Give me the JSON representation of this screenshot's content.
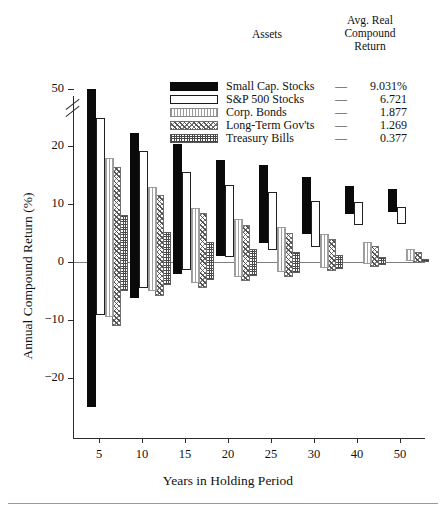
{
  "legend": {
    "assets_header": "Assets",
    "return_header": "Avg. Real\nCompound\nReturn",
    "return_header_l1": "Avg. Real",
    "return_header_l2": "Compound",
    "return_header_l3": "Return",
    "dash": "—",
    "rows": [
      {
        "swatch": "small-cap-swatch",
        "label": "Small Cap. Stocks",
        "value": "9.031%"
      },
      {
        "swatch": "sp500-swatch",
        "label": "S&P 500 Stocks",
        "value": "6.721"
      },
      {
        "swatch": "corp-bonds-swatch",
        "label": "Corp. Bonds",
        "value": "1.877"
      },
      {
        "swatch": "ltgov-swatch",
        "label": "Long-Term Gov'ts",
        "value": "1.269"
      },
      {
        "swatch": "tbills-swatch",
        "label": "Treasury Bills",
        "value": "0.377"
      }
    ]
  },
  "chart_data": {
    "type": "bar",
    "subtype": "range-bars-high-low",
    "title": "",
    "xlabel": "Years in Holding Period",
    "ylabel": "Annual Compound Return (%)",
    "x": [
      5,
      10,
      15,
      20,
      25,
      30,
      40,
      50
    ],
    "categories": [
      "5",
      "10",
      "15",
      "20",
      "25",
      "30",
      "40",
      "50"
    ],
    "xtick_labels": [
      "5",
      "10",
      "15",
      "20",
      "25",
      "30",
      "40",
      "50"
    ],
    "ytick_labels": [
      "50",
      "20",
      "10",
      "0",
      "-10",
      "-20"
    ],
    "yticks": [
      50,
      20,
      10,
      0,
      -10,
      -20
    ],
    "ylim": [
      -26,
      51
    ],
    "y_axis_break": {
      "between": [
        25,
        45
      ],
      "note": "axis broken above 25%"
    },
    "grid": false,
    "zero_line": true,
    "legend_position": "top-right",
    "series": [
      {
        "name": "Small Cap. Stocks",
        "avg_real_compound_return": 9.031,
        "color": "#0a0a0a",
        "fill": "solid-black",
        "ranges": [
          {
            "x": 5,
            "high": 50.0,
            "low": -25.0
          },
          {
            "x": 10,
            "high": 22.3,
            "low": -6.2
          },
          {
            "x": 15,
            "high": 20.4,
            "low": -2.1
          },
          {
            "x": 20,
            "high": 17.6,
            "low": 1.0
          },
          {
            "x": 25,
            "high": 16.8,
            "low": 3.3
          },
          {
            "x": 30,
            "high": 14.6,
            "low": 4.9
          },
          {
            "x": 40,
            "high": 13.1,
            "low": 8.3
          },
          {
            "x": 50,
            "high": 12.6,
            "low": 8.6
          }
        ]
      },
      {
        "name": "S&P 500 Stocks",
        "avg_real_compound_return": 6.721,
        "color": "#ffffff",
        "fill": "white-outline",
        "ranges": [
          {
            "x": 5,
            "high": 24.8,
            "low": -9.2
          },
          {
            "x": 10,
            "high": 19.2,
            "low": -4.5
          },
          {
            "x": 15,
            "high": 15.5,
            "low": -1.3
          },
          {
            "x": 20,
            "high": 13.2,
            "low": 0.9
          },
          {
            "x": 25,
            "high": 12.0,
            "low": 2.0
          },
          {
            "x": 30,
            "high": 10.6,
            "low": 2.6
          },
          {
            "x": 40,
            "high": 10.3,
            "low": 6.4
          },
          {
            "x": 50,
            "high": 9.4,
            "low": 6.5
          }
        ]
      },
      {
        "name": "Corp. Bonds",
        "avg_real_compound_return": 1.877,
        "color": "#a2a2a2",
        "fill": "light-vertical-hatch",
        "ranges": [
          {
            "x": 5,
            "high": 18.0,
            "low": -9.4
          },
          {
            "x": 10,
            "high": 13.0,
            "low": -5.0
          },
          {
            "x": 15,
            "high": 9.3,
            "low": -3.6
          },
          {
            "x": 20,
            "high": 7.4,
            "low": -2.6
          },
          {
            "x": 25,
            "high": 6.0,
            "low": -1.8
          },
          {
            "x": 30,
            "high": 4.9,
            "low": -1.0
          },
          {
            "x": 40,
            "high": 3.5,
            "low": -0.3
          },
          {
            "x": 50,
            "high": 2.2,
            "low": 0.1
          }
        ]
      },
      {
        "name": "Long-Term Gov'ts",
        "avg_real_compound_return": 1.269,
        "color": "#5f5f5f",
        "fill": "cross-diagonal-hatch",
        "ranges": [
          {
            "x": 5,
            "high": 16.4,
            "low": -11.0
          },
          {
            "x": 10,
            "high": 11.6,
            "low": -5.9
          },
          {
            "x": 15,
            "high": 8.4,
            "low": -4.4
          },
          {
            "x": 20,
            "high": 6.4,
            "low": -3.3
          },
          {
            "x": 25,
            "high": 5.0,
            "low": -2.5
          },
          {
            "x": 30,
            "high": 4.0,
            "low": -1.6
          },
          {
            "x": 40,
            "high": 2.7,
            "low": -0.8
          },
          {
            "x": 50,
            "high": 1.7,
            "low": -0.2
          }
        ]
      },
      {
        "name": "Treasury Bills",
        "avg_real_compound_return": 0.377,
        "color": "#4a4a4a",
        "fill": "dense-grid-hatch",
        "ranges": [
          {
            "x": 5,
            "high": 8.1,
            "low": -5.0
          },
          {
            "x": 10,
            "high": 5.2,
            "low": -4.0
          },
          {
            "x": 15,
            "high": 3.4,
            "low": -3.1
          },
          {
            "x": 20,
            "high": 2.3,
            "low": -2.4
          },
          {
            "x": 25,
            "high": 1.7,
            "low": -1.9
          },
          {
            "x": 30,
            "high": 1.2,
            "low": -1.2
          },
          {
            "x": 40,
            "high": 0.8,
            "low": -0.5
          },
          {
            "x": 50,
            "high": 0.6,
            "low": 0.0
          }
        ]
      }
    ]
  }
}
